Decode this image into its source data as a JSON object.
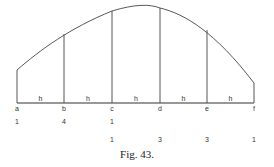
{
  "figure": {
    "caption": "Fig. 43.",
    "baseline_y": 103,
    "curve_path": "M17,70 C40,50 70,28 112,11 C135,4 150,4 160,8 C185,14 215,32 254,83",
    "ordinates": [
      {
        "name": "a",
        "x": 17,
        "top": 70,
        "weight": "1",
        "weight_row": 1
      },
      {
        "name": "b",
        "x": 64,
        "top": 34,
        "weight": "4",
        "weight_row": 1
      },
      {
        "name": "c",
        "x": 112,
        "top": 11,
        "weight": "1",
        "weight_row": 1
      },
      {
        "name": "c2",
        "x": 112,
        "top": 11,
        "weight": "1",
        "weight_row": 2
      },
      {
        "name": "d",
        "x": 160,
        "top": 8,
        "weight": "3",
        "weight_row": 2
      },
      {
        "name": "e",
        "x": 207,
        "top": 30,
        "weight": "3",
        "weight_row": 2
      },
      {
        "name": "f",
        "x": 254,
        "top": 83,
        "weight": "1",
        "weight_row": 2
      }
    ],
    "point_labels": [
      "a",
      "b",
      "c",
      "d",
      "e",
      "f"
    ],
    "interval_label": "h",
    "weights_row1": [
      "1",
      "4",
      "1"
    ],
    "weights_row2": [
      "1",
      "3",
      "3",
      "1"
    ]
  }
}
